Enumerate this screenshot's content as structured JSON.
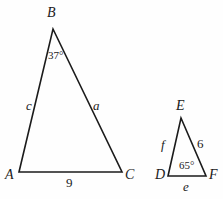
{
  "figure": {
    "stroke_color": "#1b1b1b",
    "background_color": "#fefefe"
  },
  "triangle_abc": {
    "name": "triangle-abc",
    "vertices": {
      "A": {
        "label": "A",
        "x": 19,
        "y": 172
      },
      "B": {
        "label": "B",
        "x": 53,
        "y": 29
      },
      "C": {
        "label": "C",
        "x": 122,
        "y": 172
      }
    },
    "angles": [
      {
        "at": "B",
        "label": "37°",
        "value": 37
      }
    ],
    "sides": [
      {
        "name": "AB",
        "label": "c"
      },
      {
        "name": "BC",
        "label": "a"
      },
      {
        "name": "AC",
        "label": "9",
        "value": 9
      }
    ]
  },
  "triangle_def": {
    "name": "triangle-def",
    "vertices": {
      "D": {
        "label": "D",
        "x": 168,
        "y": 176
      },
      "E": {
        "label": "E",
        "x": 181,
        "y": 118
      },
      "F": {
        "label": "F",
        "x": 206,
        "y": 176
      }
    },
    "angles": [
      {
        "at": "D",
        "label": "65°",
        "value": 65
      }
    ],
    "sides": [
      {
        "name": "DE",
        "label": "f"
      },
      {
        "name": "EF",
        "label": "6",
        "value": 6
      },
      {
        "name": "DF",
        "label": "e"
      }
    ]
  }
}
